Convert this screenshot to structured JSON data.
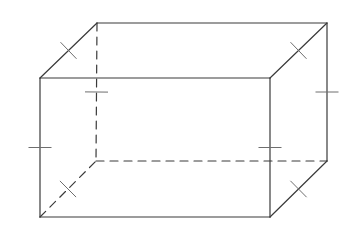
{
  "diagram": {
    "type": "rectangular-prism",
    "colors": {
      "background": "#ffffff",
      "edge": "#3a3a3a",
      "tick": "#6e6e6e"
    },
    "vertices": {
      "front_top_left": [
        40,
        78
      ],
      "front_top_right": [
        270,
        78
      ],
      "front_bottom_left": [
        40,
        217
      ],
      "front_bottom_right": [
        270,
        217
      ],
      "back_top_left": [
        97,
        23
      ],
      "back_top_right": [
        327,
        23
      ],
      "back_bottom_left": [
        96,
        161
      ],
      "back_bottom_right": [
        327,
        161
      ]
    },
    "edges": [
      {
        "name": "front-top-edge",
        "from": "front_top_left",
        "to": "front_top_right",
        "hidden": false
      },
      {
        "name": "front-bottom-edge",
        "from": "front_bottom_left",
        "to": "front_bottom_right",
        "hidden": false
      },
      {
        "name": "front-left-edge",
        "from": "front_top_left",
        "to": "front_bottom_left",
        "hidden": false
      },
      {
        "name": "front-right-edge",
        "from": "front_top_right",
        "to": "front_bottom_right",
        "hidden": false
      },
      {
        "name": "back-top-edge",
        "from": "back_top_left",
        "to": "back_top_right",
        "hidden": false
      },
      {
        "name": "back-right-edge",
        "from": "back_top_right",
        "to": "back_bottom_right",
        "hidden": false
      },
      {
        "name": "top-left-depth-edge",
        "from": "front_top_left",
        "to": "back_top_left",
        "hidden": false
      },
      {
        "name": "top-right-depth-edge",
        "from": "front_top_right",
        "to": "back_top_right",
        "hidden": false
      },
      {
        "name": "bottom-right-depth-edge",
        "from": "front_bottom_right",
        "to": "back_bottom_right",
        "hidden": false
      },
      {
        "name": "back-left-edge",
        "from": "back_top_left",
        "to": "back_bottom_left",
        "hidden": true
      },
      {
        "name": "back-bottom-edge",
        "from": "back_bottom_left",
        "to": "back_bottom_right",
        "hidden": true
      },
      {
        "name": "bottom-left-depth-edge",
        "from": "front_bottom_left",
        "to": "back_bottom_left",
        "hidden": true
      }
    ],
    "tick_marks": [
      {
        "name": "tick-front-left-edge",
        "edge": "front-left-edge",
        "count": 1
      },
      {
        "name": "tick-front-right-edge",
        "edge": "front-right-edge",
        "count": 1
      },
      {
        "name": "tick-back-left-edge",
        "edge": "back-left-edge",
        "count": 1
      },
      {
        "name": "tick-back-right-edge",
        "edge": "back-right-edge",
        "count": 1
      },
      {
        "name": "tick-top-left-depth-edge",
        "edge": "top-left-depth-edge",
        "count": 1
      },
      {
        "name": "tick-top-right-depth-edge",
        "edge": "top-right-depth-edge",
        "count": 1
      },
      {
        "name": "tick-bottom-left-depth-edge",
        "edge": "bottom-left-depth-edge",
        "count": 1
      },
      {
        "name": "tick-bottom-right-depth-edge",
        "edge": "bottom-right-depth-edge",
        "count": 1
      }
    ]
  }
}
